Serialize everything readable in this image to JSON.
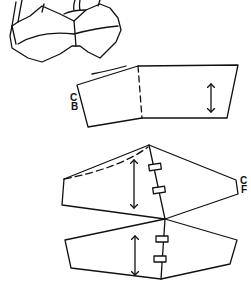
{
  "diagram": {
    "type": "sewing-pattern",
    "illustration": "bra-garment-sketch",
    "pieces": [
      {
        "name": "band-piece",
        "label": "CB",
        "label_meaning": "center back",
        "grainline": true,
        "has_dashed_fold_line": true
      },
      {
        "name": "upper-cup-piece",
        "label": "CF",
        "label_meaning": "center front",
        "grainline": true,
        "notches": 2,
        "has_dashed_seam_line": true
      },
      {
        "name": "lower-cup-piece",
        "grainline": true,
        "notches": 2
      }
    ],
    "labels": {
      "cb_top": "C",
      "cb_bottom": "B",
      "cf_top": "C",
      "cf_bottom": "F"
    },
    "line_color": "#111111",
    "background": "#ffffff"
  }
}
